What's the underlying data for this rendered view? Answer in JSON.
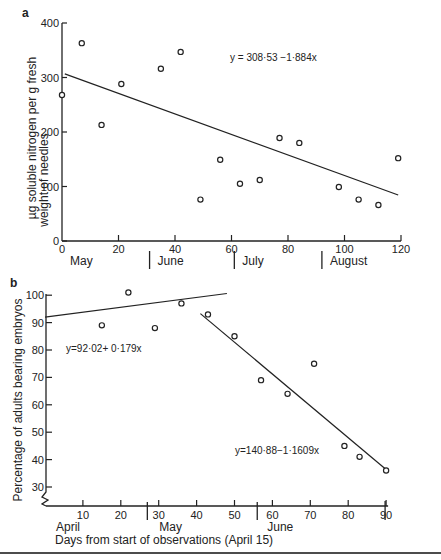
{
  "chart_data": [
    {
      "panel": "a",
      "type": "scatter",
      "title": "",
      "xlabel": "",
      "ylabel": "µg soluble nitrogen per g fresh weight of needles",
      "xlim": [
        0,
        120
      ],
      "ylim": [
        0,
        400
      ],
      "xticks": [
        0,
        20,
        40,
        60,
        80,
        100,
        120
      ],
      "yticks": [
        0,
        100,
        200,
        300,
        400
      ],
      "months": [
        {
          "label": "May",
          "start": 0
        },
        {
          "label": "June",
          "start": 31
        },
        {
          "label": "July",
          "start": 61
        },
        {
          "label": "August",
          "start": 92
        }
      ],
      "points": [
        {
          "x": 0,
          "y": 268
        },
        {
          "x": 7,
          "y": 363
        },
        {
          "x": 14,
          "y": 213
        },
        {
          "x": 21,
          "y": 288
        },
        {
          "x": 35,
          "y": 316
        },
        {
          "x": 42,
          "y": 347
        },
        {
          "x": 49,
          "y": 76
        },
        {
          "x": 56,
          "y": 149
        },
        {
          "x": 63,
          "y": 105
        },
        {
          "x": 70,
          "y": 112
        },
        {
          "x": 77,
          "y": 189
        },
        {
          "x": 84,
          "y": 180
        },
        {
          "x": 98,
          "y": 99
        },
        {
          "x": 105,
          "y": 76
        },
        {
          "x": 112,
          "y": 66
        },
        {
          "x": 119,
          "y": 152
        }
      ],
      "regression": {
        "label": "y = 308·53 −1·884x",
        "intercept": 308.53,
        "slope": -1.884,
        "x_range": [
          1,
          119
        ]
      },
      "grid": false
    },
    {
      "panel": "b",
      "type": "scatter",
      "title": "",
      "xlabel": "Days from start of observations (April 15)",
      "ylabel": "Percentage of adults bearing embryos",
      "xlim": [
        0,
        90
      ],
      "ylim": [
        25,
        100
      ],
      "xticks": [
        10,
        20,
        30,
        40,
        50,
        60,
        70,
        80,
        90
      ],
      "yticks": [
        30,
        40,
        50,
        60,
        70,
        80,
        90,
        100
      ],
      "months": [
        {
          "label": "April",
          "start": 0
        },
        {
          "label": "May",
          "start": 27
        },
        {
          "label": "June",
          "start": 56
        }
      ],
      "points": [
        {
          "x": 15,
          "y": 89
        },
        {
          "x": 22,
          "y": 101
        },
        {
          "x": 29,
          "y": 88
        },
        {
          "x": 36,
          "y": 97
        },
        {
          "x": 43,
          "y": 93
        },
        {
          "x": 50,
          "y": 85
        },
        {
          "x": 57,
          "y": 69
        },
        {
          "x": 64,
          "y": 64
        },
        {
          "x": 71,
          "y": 75
        },
        {
          "x": 79,
          "y": 45
        },
        {
          "x": 83,
          "y": 41
        },
        {
          "x": 90,
          "y": 36
        }
      ],
      "regressions": [
        {
          "label": "y=92·02+ 0·179x",
          "intercept": 92.02,
          "slope": 0.179,
          "x_range": [
            0,
            48
          ]
        },
        {
          "label": "y=140·88−1·1609x",
          "intercept": 140.88,
          "slope": -1.1609,
          "x_range": [
            41,
            90
          ]
        }
      ],
      "grid": false
    }
  ],
  "labels": {
    "panel_a": "a",
    "panel_b": "b",
    "ylabel_a_line1": "µg soluble nitrogen per g fresh",
    "ylabel_a_line2": "weight of needles"
  }
}
